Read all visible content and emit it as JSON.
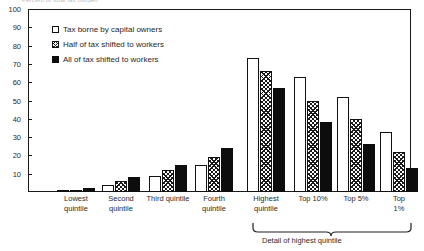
{
  "top_clipped_label": "Percent of total tax burden",
  "legend": {
    "position": "inside-top-left",
    "items": [
      {
        "label": "Tax borne by capital owners",
        "swatch": "open-white-square-icon",
        "color": "#ffffff"
      },
      {
        "label": "Half of tax shifted to workers",
        "swatch": "hatched-square-icon",
        "color": "#808080"
      },
      {
        "label": "All of tax shifted to workers",
        "swatch": "filled-black-square-icon",
        "color": "#0d0d0d"
      }
    ]
  },
  "annotation": {
    "brace_label": "Detail of highest quintile",
    "brace_spans": [
      "Top 10%",
      "Top 5%",
      "Top 1%"
    ]
  },
  "chart_data": {
    "type": "bar",
    "title": "",
    "subtitle": "",
    "xlabel": "",
    "ylabel": "",
    "ylim": [
      0,
      100
    ],
    "yticks": [
      0,
      10,
      20,
      30,
      40,
      50,
      60,
      70,
      80,
      90,
      100
    ],
    "ytick_labels": [
      "",
      "10",
      "20",
      "30",
      "40",
      "50",
      "60",
      "70",
      "80",
      "90",
      "100"
    ],
    "grid": false,
    "legend_position": "upper left inside",
    "categories": [
      "Lowest\nquintile",
      "Second\nquintile",
      "Third quintile",
      "Fourth\nquintile",
      "Highest\nquintile",
      "Top 10%",
      "Top 5%",
      "Top 1%"
    ],
    "series": [
      {
        "name": "Tax borne by capital owners",
        "values": [
          1,
          4,
          9,
          15,
          73,
          63,
          52,
          33
        ]
      },
      {
        "name": "Half of tax shifted to workers",
        "values": [
          1,
          6,
          12,
          19,
          66,
          50,
          40,
          22
        ]
      },
      {
        "name": "All of tax shifted to workers",
        "values": [
          2,
          8,
          15,
          24,
          57,
          38,
          26,
          13
        ]
      }
    ]
  }
}
